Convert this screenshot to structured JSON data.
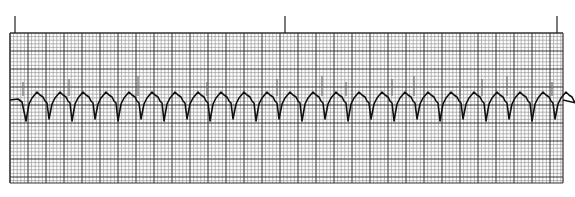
{
  "chart_data": {
    "type": "line",
    "title": "",
    "xlabel": "",
    "ylabel": "",
    "grid": true,
    "grid_spec": {
      "left": 10,
      "top": 33,
      "right": 563,
      "bottom": 183,
      "small_box_px": 3.6,
      "large_box_px": 18,
      "small_color": "#9a9a9a",
      "large_color": "#333333"
    },
    "time_markers_x": [
      15,
      285,
      557
    ],
    "trace_color": "#111111",
    "baseline_y": 100,
    "beat_interval_px": 23,
    "beat_count": 24,
    "first_beat_x": 26,
    "beat_shape": {
      "s_wave_depth": 21,
      "t_wave_height": 8,
      "spike_height": 18
    },
    "spikes_x": [
      23,
      69,
      138,
      207,
      277,
      322,
      346,
      392,
      414,
      460,
      482,
      507,
      552
    ]
  }
}
